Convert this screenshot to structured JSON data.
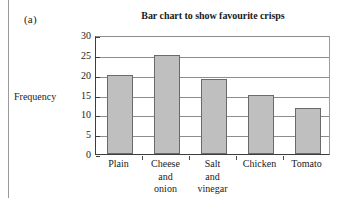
{
  "panel": {
    "label": "(a)"
  },
  "chart_data": {
    "type": "bar",
    "title": "Bar chart to show favourite crisps",
    "xlabel": "",
    "ylabel": "Frequency",
    "categories": [
      "Plain",
      "Cheese and onion",
      "Salt and vinegar",
      "Chicken",
      "Tomato"
    ],
    "category_lines": [
      [
        "Plain"
      ],
      [
        "Cheese",
        "and",
        "onion"
      ],
      [
        "Salt",
        "and",
        "vinegar"
      ],
      [
        "Chicken"
      ],
      [
        "Tomato"
      ]
    ],
    "values": [
      20,
      25,
      19,
      15,
      11.5
    ],
    "ylim": [
      0,
      30
    ],
    "ytick_labels": [
      "30",
      "25",
      "20",
      "15",
      "10",
      "5",
      "0"
    ],
    "ytick_values": [
      30,
      25,
      20,
      15,
      10,
      5,
      0
    ],
    "grid": "horizontal",
    "legend": "none",
    "bar_fill": "#bfbfbf",
    "bar_border": "#6a6a6a",
    "axis_color": "#3d3d3d",
    "grid_color": "#8d8d8d"
  }
}
